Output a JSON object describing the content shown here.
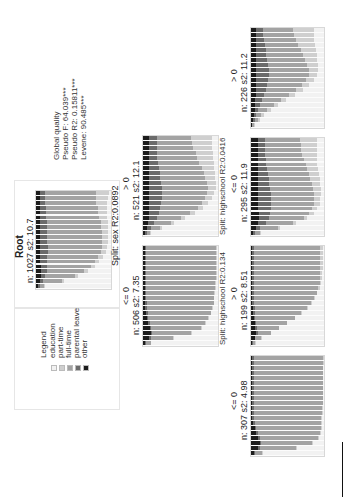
{
  "colors": {
    "education": "#f2f2f2",
    "part_time": "#cfcfcf",
    "full_time": "#a3a3a3",
    "parental_leave": "#6b6b6b",
    "other": "#1c1c1c"
  },
  "legend": {
    "title": "Legend",
    "items": [
      {
        "label": "education",
        "key": "education"
      },
      {
        "label": "part-time",
        "key": "part_time"
      },
      {
        "label": "full-time",
        "key": "full_time"
      },
      {
        "label": "parental leave",
        "key": "parental_leave"
      },
      {
        "label": "other",
        "key": "other"
      }
    ]
  },
  "global_quality": {
    "title": "Global quality",
    "pseudo_f": "Pseudo F: 64.039***",
    "pseudo_r2": "Pseudo R2: 0.15811***",
    "levene": "Levene: 90.485***"
  },
  "nodes": {
    "root": {
      "title": "Root",
      "stats": "n: 1027 s2: 10.7",
      "split": "Split: sex R2:0.0892"
    },
    "sex_gt0": {
      "condition": "> 0",
      "stats": "n: 521 s2: 12.1",
      "split": "Split: highschool R2:0.0416"
    },
    "sex_le0": {
      "condition": "<= 0",
      "stats": "n: 506 s2: 7.35",
      "split": "Split: highschool R2:0.134"
    },
    "hs_gt0_a": {
      "condition": "> 0",
      "stats": "n: 226 s2: 11.2"
    },
    "hs_le0_a": {
      "condition": "<= 0",
      "stats": "n: 295 s2: 11.9"
    },
    "hs_gt0_b": {
      "condition": "> 0",
      "stats": "n: 199 s2: 8.51"
    },
    "hs_le0_b": {
      "condition": "<= 0",
      "stats": "n: 307 s2: 4.98"
    }
  },
  "chart_data": {
    "type": "area",
    "states": [
      "other",
      "parental leave",
      "full-time",
      "part-time",
      "education"
    ],
    "note": "Each node shows per-time-point state distribution (proportions, 20 time points, early to late).",
    "series": {
      "root": {
        "other": [
          0.02,
          0.05,
          0.06,
          0.06,
          0.06,
          0.05,
          0.05,
          0.05,
          0.05,
          0.05,
          0.05,
          0.05,
          0.05,
          0.05,
          0.05,
          0.05,
          0.05,
          0.05,
          0.05,
          0.05
        ],
        "parental leave": [
          0.03,
          0.04,
          0.06,
          0.08,
          0.09,
          0.1,
          0.1,
          0.11,
          0.11,
          0.1,
          0.1,
          0.1,
          0.09,
          0.09,
          0.08,
          0.08,
          0.08,
          0.07,
          0.07,
          0.07
        ],
        "full-time": [
          0.05,
          0.25,
          0.4,
          0.5,
          0.58,
          0.63,
          0.67,
          0.7,
          0.72,
          0.73,
          0.73,
          0.73,
          0.73,
          0.72,
          0.71,
          0.7,
          0.69,
          0.68,
          0.68,
          0.68
        ],
        "part-time": [
          0.02,
          0.03,
          0.04,
          0.05,
          0.06,
          0.06,
          0.07,
          0.07,
          0.07,
          0.08,
          0.08,
          0.08,
          0.09,
          0.1,
          0.11,
          0.12,
          0.13,
          0.15,
          0.16,
          0.17
        ]
      },
      "sex_gt0": {
        "other": [
          0.02,
          0.05,
          0.07,
          0.08,
          0.08,
          0.08,
          0.08,
          0.08,
          0.08,
          0.08,
          0.08,
          0.08,
          0.08,
          0.08,
          0.08,
          0.08,
          0.08,
          0.08,
          0.08,
          0.08
        ],
        "parental leave": [
          0.03,
          0.05,
          0.08,
          0.11,
          0.13,
          0.15,
          0.16,
          0.17,
          0.17,
          0.17,
          0.16,
          0.15,
          0.14,
          0.13,
          0.12,
          0.11,
          0.11,
          0.1,
          0.1,
          0.1
        ],
        "full-time": [
          0.04,
          0.12,
          0.22,
          0.32,
          0.42,
          0.5,
          0.55,
          0.58,
          0.6,
          0.61,
          0.61,
          0.6,
          0.59,
          0.57,
          0.55,
          0.53,
          0.51,
          0.49,
          0.47,
          0.46
        ],
        "part-time": [
          0.02,
          0.03,
          0.04,
          0.05,
          0.06,
          0.07,
          0.08,
          0.09,
          0.1,
          0.11,
          0.12,
          0.13,
          0.15,
          0.17,
          0.19,
          0.21,
          0.23,
          0.25,
          0.27,
          0.28
        ]
      },
      "sex_le0": {
        "other": [
          0.03,
          0.08,
          0.1,
          0.09,
          0.07,
          0.05,
          0.04,
          0.03,
          0.03,
          0.02,
          0.02,
          0.02,
          0.02,
          0.02,
          0.02,
          0.02,
          0.02,
          0.02,
          0.02,
          0.02
        ],
        "parental leave": [
          0.01,
          0.02,
          0.02,
          0.02,
          0.02,
          0.02,
          0.02,
          0.02,
          0.02,
          0.02,
          0.02,
          0.02,
          0.02,
          0.02,
          0.02,
          0.02,
          0.02,
          0.02,
          0.02,
          0.02
        ],
        "full-time": [
          0.06,
          0.3,
          0.52,
          0.66,
          0.74,
          0.8,
          0.84,
          0.87,
          0.89,
          0.9,
          0.91,
          0.92,
          0.92,
          0.93,
          0.93,
          0.93,
          0.93,
          0.93,
          0.93,
          0.93
        ],
        "part-time": [
          0.01,
          0.01,
          0.01,
          0.01,
          0.01,
          0.01,
          0.01,
          0.01,
          0.01,
          0.01,
          0.01,
          0.01,
          0.01,
          0.01,
          0.01,
          0.01,
          0.01,
          0.01,
          0.01,
          0.02
        ]
      },
      "hs_gt0_a": {
        "other": [
          0.01,
          0.03,
          0.04,
          0.05,
          0.06,
          0.06,
          0.07,
          0.07,
          0.07,
          0.07,
          0.07,
          0.07,
          0.07,
          0.07,
          0.07,
          0.07,
          0.07,
          0.07,
          0.07,
          0.07
        ],
        "parental leave": [
          0.01,
          0.02,
          0.03,
          0.05,
          0.07,
          0.09,
          0.11,
          0.13,
          0.15,
          0.16,
          0.17,
          0.17,
          0.16,
          0.15,
          0.14,
          0.13,
          0.12,
          0.11,
          0.1,
          0.1
        ],
        "full-time": [
          0.02,
          0.04,
          0.07,
          0.12,
          0.18,
          0.26,
          0.34,
          0.42,
          0.48,
          0.53,
          0.55,
          0.55,
          0.54,
          0.52,
          0.5,
          0.48,
          0.46,
          0.44,
          0.42,
          0.4
        ],
        "part-time": [
          0.02,
          0.03,
          0.04,
          0.05,
          0.06,
          0.07,
          0.08,
          0.09,
          0.1,
          0.11,
          0.12,
          0.13,
          0.15,
          0.17,
          0.19,
          0.21,
          0.23,
          0.25,
          0.27,
          0.3
        ]
      },
      "hs_le0_a": {
        "other": [
          0.03,
          0.07,
          0.1,
          0.11,
          0.11,
          0.1,
          0.1,
          0.09,
          0.09,
          0.09,
          0.09,
          0.09,
          0.09,
          0.09,
          0.09,
          0.09,
          0.09,
          0.09,
          0.09,
          0.09
        ],
        "parental leave": [
          0.03,
          0.06,
          0.1,
          0.13,
          0.15,
          0.17,
          0.18,
          0.18,
          0.18,
          0.17,
          0.16,
          0.15,
          0.14,
          0.13,
          0.12,
          0.11,
          0.1,
          0.1,
          0.1,
          0.1
        ],
        "full-time": [
          0.06,
          0.24,
          0.38,
          0.48,
          0.54,
          0.57,
          0.58,
          0.59,
          0.59,
          0.59,
          0.58,
          0.57,
          0.56,
          0.55,
          0.54,
          0.52,
          0.51,
          0.5,
          0.49,
          0.48
        ],
        "part-time": [
          0.02,
          0.03,
          0.04,
          0.05,
          0.06,
          0.07,
          0.08,
          0.09,
          0.1,
          0.11,
          0.12,
          0.13,
          0.14,
          0.15,
          0.16,
          0.18,
          0.2,
          0.22,
          0.23,
          0.24
        ]
      },
      "hs_gt0_b": {
        "other": [
          0.02,
          0.05,
          0.07,
          0.06,
          0.05,
          0.04,
          0.03,
          0.03,
          0.02,
          0.02,
          0.02,
          0.02,
          0.02,
          0.02,
          0.02,
          0.02,
          0.02,
          0.02,
          0.02,
          0.02
        ],
        "parental leave": [
          0.01,
          0.01,
          0.02,
          0.02,
          0.02,
          0.02,
          0.02,
          0.02,
          0.02,
          0.02,
          0.02,
          0.02,
          0.02,
          0.02,
          0.02,
          0.02,
          0.02,
          0.02,
          0.02,
          0.02
        ],
        "full-time": [
          0.03,
          0.08,
          0.18,
          0.3,
          0.42,
          0.54,
          0.64,
          0.72,
          0.78,
          0.83,
          0.86,
          0.88,
          0.9,
          0.91,
          0.91,
          0.91,
          0.91,
          0.91,
          0.91,
          0.9
        ],
        "part-time": [
          0.01,
          0.01,
          0.01,
          0.01,
          0.01,
          0.01,
          0.01,
          0.01,
          0.01,
          0.01,
          0.01,
          0.02,
          0.02,
          0.02,
          0.02,
          0.03,
          0.03,
          0.03,
          0.03,
          0.04
        ]
      },
      "hs_le0_b": {
        "other": [
          0.04,
          0.1,
          0.12,
          0.1,
          0.07,
          0.05,
          0.03,
          0.02,
          0.02,
          0.02,
          0.02,
          0.02,
          0.02,
          0.02,
          0.02,
          0.02,
          0.02,
          0.02,
          0.02,
          0.02
        ],
        "parental leave": [
          0.01,
          0.02,
          0.02,
          0.02,
          0.02,
          0.02,
          0.02,
          0.02,
          0.02,
          0.02,
          0.02,
          0.02,
          0.02,
          0.02,
          0.02,
          0.02,
          0.02,
          0.02,
          0.02,
          0.02
        ],
        "full-time": [
          0.1,
          0.5,
          0.7,
          0.8,
          0.86,
          0.89,
          0.91,
          0.92,
          0.93,
          0.93,
          0.94,
          0.94,
          0.94,
          0.94,
          0.94,
          0.94,
          0.94,
          0.94,
          0.95,
          0.95
        ],
        "part-time": [
          0.01,
          0.01,
          0.01,
          0.01,
          0.01,
          0.01,
          0.01,
          0.01,
          0.01,
          0.01,
          0.01,
          0.01,
          0.01,
          0.01,
          0.01,
          0.01,
          0.01,
          0.01,
          0.01,
          0.01
        ]
      }
    }
  }
}
